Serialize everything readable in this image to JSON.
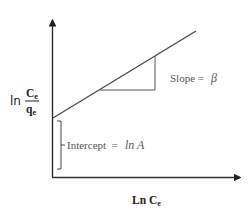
{
  "diagram": {
    "type": "linearized isotherm plot",
    "y_axis_label": {
      "prefix": "ln",
      "numerator": "C",
      "numerator_sub": "e",
      "denominator": "q",
      "denominator_sub": "e"
    },
    "x_axis_label": {
      "text": "Ln C",
      "sub": "e"
    },
    "slope_label": {
      "text": "Slope = ",
      "symbol": "β"
    },
    "intercept_label": {
      "text": "Intercept  = ",
      "expression": "ln A"
    },
    "colors": {
      "axes": "#222222",
      "line": "#444444",
      "labels": "#555555"
    }
  }
}
